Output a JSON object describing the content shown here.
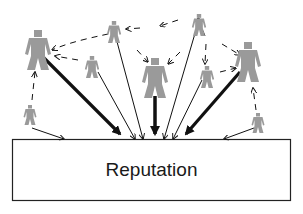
{
  "diagram": {
    "title": "Reputation",
    "box_label": "Reputation",
    "colors": {
      "person": "#9a9a9a",
      "arrow": "#111111",
      "box_border": "#222222",
      "background": "#ffffff"
    },
    "people": [
      {
        "id": "p1",
        "x": 38,
        "y": 30,
        "scale": 1.0
      },
      {
        "id": "p2",
        "x": 114,
        "y": 21,
        "scale": 0.55
      },
      {
        "id": "p3",
        "x": 92,
        "y": 56,
        "scale": 0.55
      },
      {
        "id": "p4",
        "x": 155,
        "y": 58,
        "scale": 1.0
      },
      {
        "id": "p5",
        "x": 199,
        "y": 14,
        "scale": 0.55
      },
      {
        "id": "p6",
        "x": 207,
        "y": 66,
        "scale": 0.55
      },
      {
        "id": "p7",
        "x": 248,
        "y": 42,
        "scale": 1.0
      },
      {
        "id": "p8",
        "x": 30,
        "y": 105,
        "scale": 0.5
      },
      {
        "id": "p9",
        "x": 258,
        "y": 113,
        "scale": 0.5
      }
    ],
    "nodes_shown": 9
  }
}
